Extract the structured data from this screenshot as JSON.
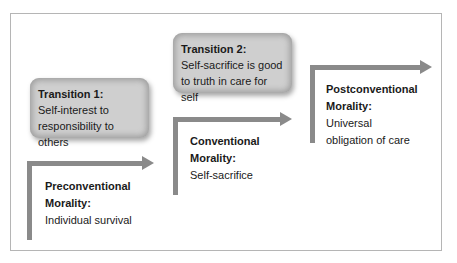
{
  "diagram": {
    "stages": [
      {
        "title_line1": "Preconventional",
        "title_line2": "Morality:",
        "desc": "Individual survival"
      },
      {
        "title_line1": "Conventional",
        "title_line2": "Morality:",
        "desc": "Self-sacrifice"
      },
      {
        "title_line1": "Postconventional",
        "title_line2": "Morality:",
        "desc_line1": "Universal",
        "desc_line2": "obligation of care"
      }
    ],
    "transitions": [
      {
        "title": "Transition 1:",
        "desc_line1": "Self-interest to",
        "desc_line2": "responsibility to others"
      },
      {
        "title": "Transition 2:",
        "desc_line1": "Self-sacrifice is good",
        "desc_line2": "to truth in care for self"
      }
    ],
    "colors": {
      "arrow": "#8a8a8a",
      "box_fill": "#cfcfcf",
      "frame": "#b5b5b5"
    }
  }
}
